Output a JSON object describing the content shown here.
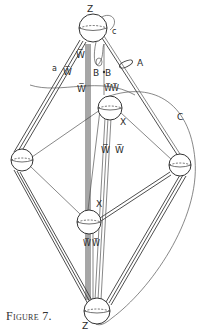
{
  "caption": "Figure 7.",
  "labels": {
    "top_vertex": "Z",
    "bottom_vertex": "Z",
    "upper_inner_vertex": "X",
    "lower_inner_vertex": "X",
    "ellipse": "A",
    "b_left": "B",
    "b_right": "B",
    "curve": "C",
    "small_a": "a",
    "w_upper": "W̅",
    "w_middle": "W̅",
    "w_left": "W̅",
    "w_center_left": "W̅",
    "w_center_right": "W̅",
    "w_right_top": "W̅",
    "w_right_top2": "W̅",
    "w_lower_left": "W̅",
    "w_lower_right": "W̅",
    "c_small": "c"
  },
  "colors": {
    "ink": "#333333",
    "paper": "#ffffff"
  }
}
